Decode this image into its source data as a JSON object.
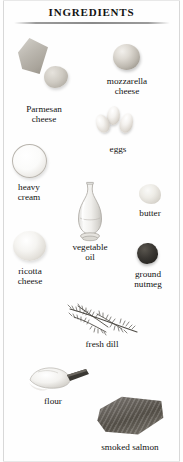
{
  "page": {
    "title": "Ingredients",
    "background_color": "#fefefe",
    "text_color": "#131313",
    "border_color": "#d8d8d8"
  },
  "ingredients": [
    {
      "id": "parmesan-cheese",
      "label": "Parmesan\ncheese",
      "icon": "parmesan-wedge-illustration"
    },
    {
      "id": "mozzarella-cheese",
      "label": "mozzarella\ncheese",
      "icon": "mozzarella-ball-illustration"
    },
    {
      "id": "eggs",
      "label": "eggs",
      "icon": "eggs-illustration"
    },
    {
      "id": "heavy-cream",
      "label": "heavy\ncream",
      "icon": "cream-bowl-illustration"
    },
    {
      "id": "vegetable-oil",
      "label": "vegetable\noil",
      "icon": "oil-carafe-illustration"
    },
    {
      "id": "butter",
      "label": "butter",
      "icon": "butter-lump-illustration"
    },
    {
      "id": "ricotta-cheese",
      "label": "ricotta\ncheese",
      "icon": "ricotta-illustration"
    },
    {
      "id": "ground-nutmeg",
      "label": "ground\nnutmeg",
      "icon": "nutmeg-illustration"
    },
    {
      "id": "fresh-dill",
      "label": "fresh dill",
      "icon": "dill-sprig-illustration"
    },
    {
      "id": "flour",
      "label": "flour",
      "icon": "flour-scoop-illustration"
    },
    {
      "id": "smoked-salmon",
      "label": "smoked salmon",
      "icon": "salmon-fillet-illustration"
    }
  ]
}
